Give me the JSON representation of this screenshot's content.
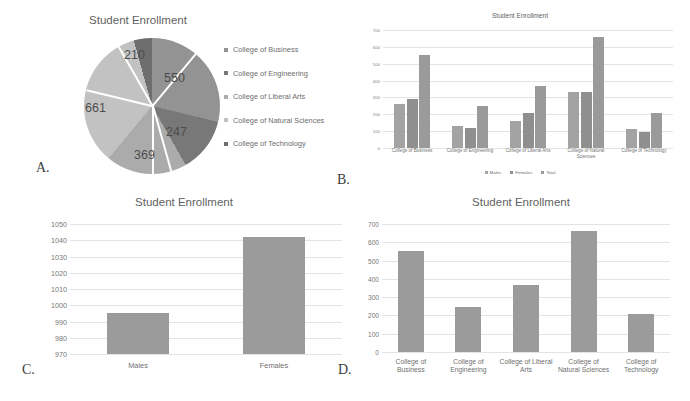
{
  "panels": {
    "a": {
      "letter": "A.",
      "title": "Student Enrollment"
    },
    "b": {
      "letter": "B.",
      "title": "Student Enrollment"
    },
    "c": {
      "letter": "C.",
      "title": "Student Enrollment"
    },
    "d": {
      "letter": "D.",
      "title": "Student Enrollment"
    }
  },
  "colors": {
    "business": "#939393",
    "engineering": "#787878",
    "liberal_arts": "#ababab",
    "natural_sciences": "#c2c2c2",
    "technology": "#6e6e6e",
    "bar_males": "#a3a3a3",
    "bar_females": "#8f8f8f",
    "bar_total": "#9a9a9a",
    "bar_single": "#9b9b9b",
    "grid": "#e4e4e4",
    "text": "#6d6d6d"
  },
  "chart_data": [
    {
      "id": "pie-enrollment",
      "type": "pie",
      "title": "Student Enrollment",
      "legend_position": "right",
      "labels": [
        "College of Business",
        "College of Engineering",
        "College of Liberal Arts",
        "College of Natural Sciences",
        "College of Technology"
      ],
      "values": [
        550,
        247,
        369,
        661,
        210
      ],
      "value_labels": [
        "550",
        "247",
        "369",
        "661",
        "210"
      ],
      "total": 2037
    },
    {
      "id": "grouped-bars-enrollment",
      "type": "bar",
      "title": "Student Enrollment",
      "xlabel": "",
      "ylabel": "",
      "ylim": [
        0,
        700
      ],
      "yticks": [
        0,
        100,
        200,
        300,
        400,
        500,
        600,
        700
      ],
      "ytick_labels": [
        "0",
        "100",
        "200",
        "300",
        "400",
        "500",
        "600",
        "700"
      ],
      "grid": true,
      "legend_position": "bottom",
      "categories": [
        "College of Business",
        "College of Engineering",
        "College of Liberal Arts",
        "College of Natural Sciences",
        "College of Technology"
      ],
      "series": [
        {
          "name": "Males",
          "values": [
            262,
            129,
            160,
            330,
            114
          ]
        },
        {
          "name": "Females",
          "values": [
            288,
            118,
            209,
            331,
            96
          ]
        },
        {
          "name": "Total",
          "values": [
            550,
            247,
            369,
            661,
            210
          ]
        }
      ]
    },
    {
      "id": "gender-totals",
      "type": "bar",
      "title": "Student Enrollment",
      "xlabel": "",
      "ylabel": "",
      "ylim": [
        970,
        1050
      ],
      "yticks": [
        970,
        980,
        990,
        1000,
        1010,
        1020,
        1030,
        1040,
        1050
      ],
      "ytick_labels": [
        "970",
        "980",
        "990",
        "1000",
        "1010",
        "1020",
        "1030",
        "1040",
        "1050"
      ],
      "grid": true,
      "categories": [
        "Males",
        "Females"
      ],
      "values": [
        995,
        1042
      ]
    },
    {
      "id": "college-totals",
      "type": "bar",
      "title": "Student Enrollment",
      "xlabel": "",
      "ylabel": "",
      "ylim": [
        0,
        700
      ],
      "yticks": [
        0,
        100,
        200,
        300,
        400,
        500,
        600,
        700
      ],
      "ytick_labels": [
        "0",
        "100",
        "200",
        "300",
        "400",
        "500",
        "600",
        "700"
      ],
      "grid": true,
      "categories": [
        "College of\nBusiness",
        "College of\nEngineering",
        "College of Liberal\nArts",
        "College of\nNatural Sciences",
        "College of\nTechnology"
      ],
      "category_lines": [
        [
          "College of",
          "Business"
        ],
        [
          "College of",
          "Engineering"
        ],
        [
          "College of Liberal",
          "Arts"
        ],
        [
          "College of",
          "Natural Sciences"
        ],
        [
          "College of",
          "Technology"
        ]
      ],
      "values": [
        550,
        247,
        369,
        661,
        210
      ]
    }
  ]
}
